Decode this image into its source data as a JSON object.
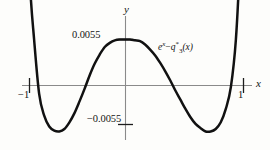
{
  "figure": {
    "title": "",
    "curve_label_parts": {
      "base": "e",
      "exponent": "x",
      "minus": "−",
      "q": "q",
      "q_star": "*",
      "q_sub": "3",
      "arg": "(x)"
    },
    "curve_label_text": "e^x − q*₃(x)",
    "axis_label_x": "x",
    "axis_label_y": "y",
    "ytick_top_label": "0.0055",
    "ytick_bottom_label": "−0.0055",
    "xtick_left_label": "−1",
    "xtick_right_label": "1",
    "colors": {
      "curve": "#111111",
      "axis": "#808080",
      "tick": "#222222",
      "text": "#141414",
      "background": "#fdfdfb"
    }
  },
  "chart_data": {
    "type": "line",
    "title": "",
    "subtitle": "",
    "xlabel": "x",
    "ylabel": "y",
    "series": [
      {
        "name": "e^x − q*₃(x)",
        "x": [
          -1.12,
          -1.08,
          -1.04,
          -1.0,
          -0.95,
          -0.9,
          -0.85,
          -0.8,
          -0.75,
          -0.7,
          -0.65,
          -0.6,
          -0.55,
          -0.5,
          -0.45,
          -0.4,
          -0.35,
          -0.3,
          -0.25,
          -0.2,
          -0.15,
          -0.1,
          -0.05,
          0.0,
          0.05,
          0.1,
          0.15,
          0.2,
          0.25,
          0.3,
          0.35,
          0.4,
          0.45,
          0.5,
          0.55,
          0.6,
          0.65,
          0.7,
          0.75,
          0.8,
          0.85,
          0.9,
          0.95,
          1.0,
          1.04,
          1.08,
          1.12
        ],
        "y": [
          0.038,
          0.0245,
          0.012,
          0.0055,
          -0.001,
          -0.0036,
          -0.0049,
          -0.0054,
          -0.0055,
          -0.0052,
          -0.0044,
          -0.0033,
          -0.0019,
          -0.0004,
          0.0012,
          0.0026,
          0.0037,
          0.0046,
          0.0051,
          0.0054,
          0.0055,
          0.0055,
          0.0055,
          0.0054,
          0.0053,
          0.0049,
          0.0043,
          0.0036,
          0.0027,
          0.0017,
          0.0006,
          -0.0006,
          -0.0017,
          -0.0028,
          -0.0038,
          -0.0046,
          -0.0051,
          -0.0055,
          -0.0055,
          -0.0052,
          -0.0044,
          -0.0028,
          -0.0002,
          0.0055,
          0.015,
          0.029,
          0.043
        ]
      }
    ],
    "xlim": [
      -1.12,
      1.12
    ],
    "ylim": [
      -0.0125,
      0.0135
    ],
    "xticks": [
      -1,
      1
    ],
    "xtick_labels": [
      "−1",
      "1"
    ],
    "yticks": [
      -0.0055,
      0.0055
    ],
    "ytick_labels": [
      "−0.0055",
      "0.0055"
    ],
    "grid": false,
    "legend": "none",
    "annotations": [
      {
        "text": "e^x − q*₃(x)",
        "x": 0.35,
        "y": 0.0082
      }
    ],
    "equioscillation_extrema": [
      {
        "x": -1.0,
        "y": 0.0055
      },
      {
        "x": -0.755,
        "y": -0.0055
      },
      {
        "x": -0.12,
        "y": 0.0055
      },
      {
        "x": 0.72,
        "y": -0.0055
      },
      {
        "x": 1.0,
        "y": 0.0055
      }
    ]
  }
}
